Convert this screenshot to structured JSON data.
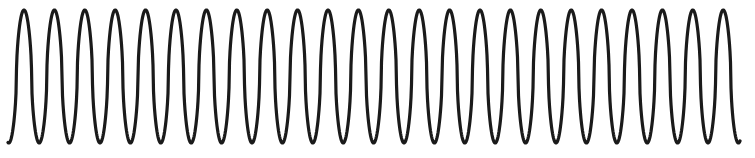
{
  "figure": {
    "name": "oscillation-waveform",
    "width": 755,
    "height": 158,
    "background_color": "#ffffff",
    "alt_text": "High-frequency oscillating waveform trace"
  },
  "chart_data": {
    "type": "line",
    "title": "",
    "subtitle": "",
    "xlabel": "",
    "ylabel": "",
    "grid": false,
    "legend": null,
    "axes_visible": false,
    "tick_labels_x": [],
    "tick_labels_y": [],
    "xlim": [
      8,
      740
    ],
    "ylim": [
      10,
      143
    ],
    "series": [
      {
        "name": "waveform",
        "color": "#1a1a1a",
        "stroke_width": 3.2,
        "waveform_shape": "sharpened-sine",
        "shape_exponent": 0.55,
        "cycles": 24,
        "period_px": 30.4,
        "first_peak_x": 24,
        "peak_y": 10,
        "trough_y": 143,
        "amplitude_px": 66.5,
        "center_y": 76.5,
        "start_x": 8,
        "start_y": 140,
        "end_x": 740,
        "end_y": 140
      }
    ]
  }
}
